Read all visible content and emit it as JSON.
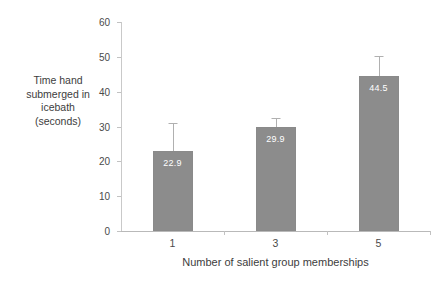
{
  "chart_data": {
    "type": "bar",
    "title": "",
    "categories": [
      "1",
      "3",
      "5"
    ],
    "values": [
      22.9,
      29.9,
      44.5
    ],
    "value_labels": [
      "22.9",
      "29.9",
      "44.5"
    ],
    "errors_upper": [
      8.1,
      2.5,
      5.6
    ],
    "xlabel": "Number of salient group memberships",
    "ylabel": "Time hand submerged in icebath (seconds)",
    "ylabel_lines": [
      "Time hand",
      "submerged in",
      "icebath",
      "(seconds)"
    ],
    "ylim": [
      0,
      60
    ],
    "ytick_values": [
      0,
      10,
      20,
      30,
      40,
      50,
      60
    ],
    "ytick_labels": [
      "0",
      "10",
      "20",
      "30",
      "40",
      "50",
      "60"
    ],
    "grid": false,
    "legend": false,
    "error_bars": "upper-only whisker with cap",
    "colors": {
      "bar_fill": "#8c8c8c",
      "bar_value_text": "#ffffff",
      "axis_line": "#c2c2c2",
      "error_bar": "#b0b0b0",
      "text": "#3d3d3d",
      "background": "#ffffff"
    }
  }
}
